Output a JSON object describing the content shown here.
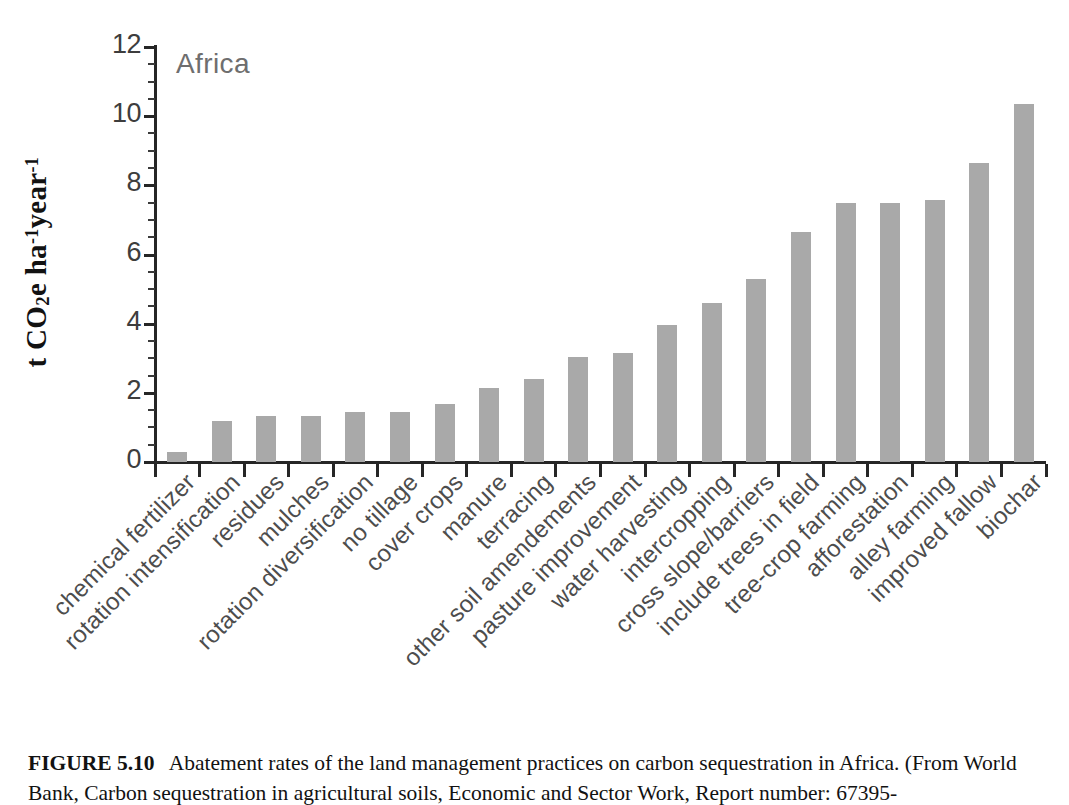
{
  "figure": {
    "caption_label": "FIGURE 5.10",
    "caption_text": "Abatement rates of the land management practices on carbon sequestration in Africa. (From World Bank, Carbon sequestration in agricultural soils, Economic and Sector Work, Report number: 67395-"
  },
  "chart_data": {
    "type": "bar",
    "title": "",
    "annotation": "Africa",
    "xlabel": "",
    "ylabel": "t CO2e ha-1year-1",
    "ylabel_parts": {
      "prefix": "t CO",
      "sub1": "2",
      "mid": "e ha",
      "sup1": "-1",
      "mid2": "year",
      "sup2": "-1"
    },
    "ylim": [
      0,
      12
    ],
    "yticks": [
      0,
      2,
      4,
      6,
      8,
      10,
      12
    ],
    "ytick_labels": [
      "0",
      "2",
      "4",
      "6",
      "8",
      "10",
      "12"
    ],
    "grid": false,
    "legend": "none",
    "bar_color": "#a9a9a9",
    "axis_color": "#262626",
    "categories": [
      "chemical fertilizer",
      "rotation intensification",
      "residues",
      "mulches",
      "rotation diversification",
      "no tillage",
      "cover crops",
      "manure",
      "terracing",
      "other soil amendements",
      "pasture improvement",
      "water harvesting",
      "intercropping",
      "cross slope/barriers",
      "include trees in field",
      "tree-crop farming",
      "afforestation",
      "alley farming",
      "improved fallow",
      "biochar"
    ],
    "values": [
      0.3,
      1.2,
      1.33,
      1.33,
      1.45,
      1.45,
      1.68,
      2.15,
      2.4,
      3.05,
      3.15,
      3.95,
      4.6,
      5.3,
      6.65,
      7.48,
      7.48,
      7.58,
      8.66,
      10.35
    ]
  }
}
